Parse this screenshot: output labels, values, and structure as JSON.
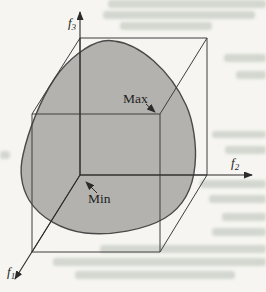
{
  "figure": {
    "axes": {
      "f1": {
        "base": "f",
        "sub": "1"
      },
      "f2": {
        "base": "f",
        "sub": "2"
      },
      "f3": {
        "base": "f",
        "sub": "3"
      }
    },
    "annotations": {
      "max_label": "Max",
      "min_label": "Min"
    }
  },
  "colors": {
    "page-bg": "#f6f5f1",
    "line": "#3e3e3e",
    "axis": "#2b2b2b",
    "blob-fill": "#b3b2af",
    "blob-stroke": "#4a4a4a",
    "label": "#1e1e1e",
    "ghost": "#a9b3a7"
  }
}
